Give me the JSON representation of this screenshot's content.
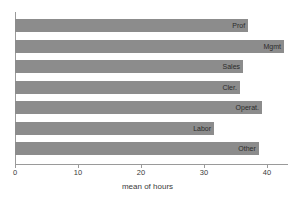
{
  "chart_data": {
    "type": "bar",
    "orientation": "horizontal",
    "title": "",
    "xlabel": "mean of hours",
    "ylabel": "",
    "xlim": [
      0,
      43.5
    ],
    "xticks": [
      0,
      10,
      20,
      30,
      40
    ],
    "grid": false,
    "legend": null,
    "bar_color": "#8c8c8c",
    "categories": [
      "Prof",
      "Mgmt",
      "Sales",
      "Cler.",
      "Operat.",
      "Labor",
      "Other"
    ],
    "values": [
      37.0,
      42.7,
      36.2,
      35.7,
      39.2,
      31.6,
      38.7
    ],
    "labels_inside_bars": true
  },
  "axis": {
    "tick_labels": [
      "0",
      "10",
      "20",
      "30",
      "40"
    ],
    "x_title": "mean of hours"
  }
}
